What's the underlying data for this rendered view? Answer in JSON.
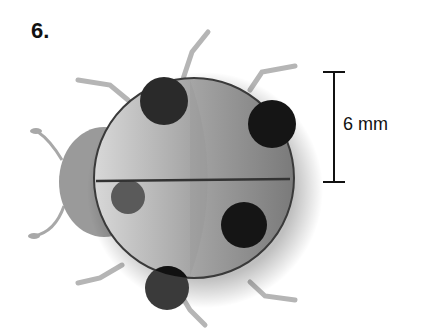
{
  "problem": {
    "number": "6."
  },
  "figure": {
    "measurement_label": "6 mm",
    "colors": {
      "body": "#8a8a8a",
      "spots": "#1a1a1a",
      "legs": "#b0b0b0",
      "head": "#9a9a9a",
      "outline": "#333333"
    }
  }
}
